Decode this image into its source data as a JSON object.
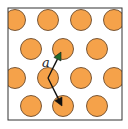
{
  "diagram": {
    "colors": {
      "atom_fill": "#F5A24A",
      "atom_stroke": "#6B4A2A",
      "frame": "#333333",
      "vector_line": "#111111",
      "vector_head_up": "#1E6B2A",
      "vector_head_down": "#111111"
    },
    "lattice": {
      "rows": 4,
      "row_pattern": [
        "aligned",
        "offset",
        "aligned",
        "offset"
      ]
    },
    "vectors": [
      {
        "name": "a1",
        "direction": "up-right"
      },
      {
        "name": "a2",
        "direction": "down-right"
      }
    ],
    "label": "a"
  }
}
